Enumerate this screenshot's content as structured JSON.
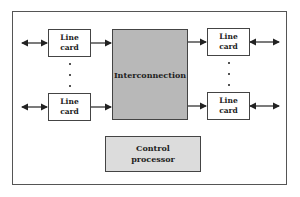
{
  "diagram": {
    "input_cards": [
      {
        "line1": "Line",
        "line2": "card"
      },
      {
        "line1": "Line",
        "line2": "card"
      }
    ],
    "output_cards": [
      {
        "line1": "Line",
        "line2": "card"
      },
      {
        "line1": "Line",
        "line2": "card"
      }
    ],
    "interconnection": {
      "label": "Interconnection"
    },
    "control_processor": {
      "line1": "Control",
      "line2": "processor"
    },
    "ellipsis": "⋮",
    "colors": {
      "interconnection_fill": "#b8b8b8",
      "control_fill": "#dcdcdc",
      "card_fill": "#ffffff",
      "border": "#444444"
    }
  }
}
